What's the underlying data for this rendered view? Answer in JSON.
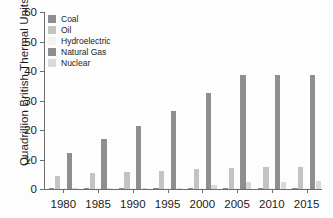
{
  "chart_data": {
    "type": "bar",
    "title": "",
    "xlabel": "",
    "ylabel": "Quadrillion British Thermal Units",
    "categories": [
      "1980",
      "1985",
      "1990",
      "1995",
      "2000",
      "2005",
      "2010",
      "2015"
    ],
    "ylim": [
      0,
      60
    ],
    "yticks": [
      0,
      10,
      20,
      30,
      40,
      50,
      60
    ],
    "grid": false,
    "legend_position": "upper-left",
    "series": [
      {
        "name": "Coal",
        "color": "#8e8e8e",
        "values": [
          0.05,
          0.05,
          0.05,
          0.05,
          0.05,
          0.05,
          0.05,
          0.05
        ]
      },
      {
        "name": "Oil",
        "color": "#c3c3c3",
        "values": [
          4.5,
          5.4,
          5.9,
          6.1,
          6.9,
          7.1,
          7.3,
          7.5
        ]
      },
      {
        "name": "Hydroelectric",
        "color": "#f2f2f2",
        "values": [
          0.05,
          0.05,
          0.05,
          0.05,
          0.05,
          0.05,
          0.05,
          0.05
        ]
      },
      {
        "name": "Natural Gas",
        "color": "#8e8e8e",
        "values": [
          12.1,
          17.0,
          21.4,
          26.4,
          32.4,
          38.8,
          38.8,
          38.8
        ]
      },
      {
        "name": "Nuclear",
        "color": "#d9d9d9",
        "values": [
          0.3,
          0.3,
          0.5,
          0.5,
          1.5,
          2.5,
          2.4,
          2.7
        ]
      }
    ]
  },
  "axes": {
    "ylabel": "Quadrillion British Thermal Units"
  }
}
